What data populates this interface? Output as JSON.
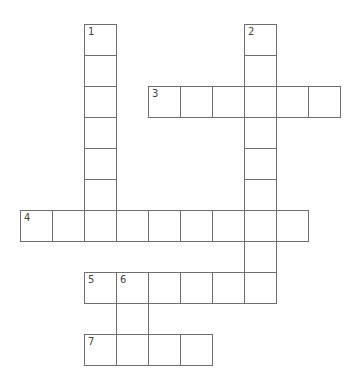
{
  "puzzle": {
    "type": "crossword",
    "origin": {
      "x": 20,
      "y": 24
    },
    "cell_w": 32,
    "cell_h": 31,
    "border_color": "#6e6e6e",
    "entries": [
      {
        "number": "1",
        "direction": "down",
        "row": 0,
        "col": 2,
        "length": 7
      },
      {
        "number": "2",
        "direction": "down",
        "row": 0,
        "col": 7,
        "length": 9
      },
      {
        "number": "3",
        "direction": "across",
        "row": 2,
        "col": 4,
        "length": 6
      },
      {
        "number": "4",
        "direction": "across",
        "row": 6,
        "col": 0,
        "length": 9
      },
      {
        "number": "5",
        "direction": "across",
        "row": 8,
        "col": 2,
        "length": 6
      },
      {
        "number": "6",
        "direction": "down",
        "row": 8,
        "col": 3,
        "length": 3
      },
      {
        "number": "7",
        "direction": "across",
        "row": 10,
        "col": 2,
        "length": 4
      }
    ]
  }
}
